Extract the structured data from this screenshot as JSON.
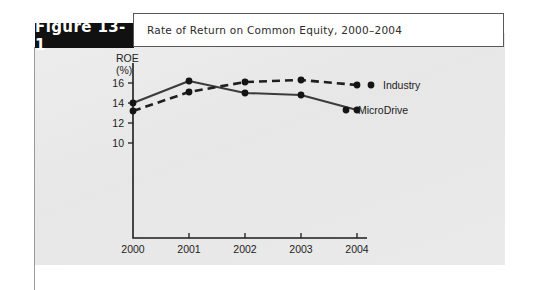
{
  "figure": {
    "tab_label": "Figure 13-1",
    "caption": "Rate of Return on Common Equity, 2000–2004"
  },
  "colors": {
    "tab_background": "#111111",
    "tab_text": "#ffffff",
    "panel_background": "#e9e9e9",
    "caption_background": "#ffffff",
    "caption_border": "#58585a",
    "axis": "#1d1d1d",
    "microdrive_line": "#3c3c3c",
    "industry_line": "#1f1f1f",
    "marker": "#141414"
  },
  "chart_data": {
    "type": "line",
    "title": "Rate of Return on Common Equity, 2000–2004",
    "xlabel": "",
    "ylabel": "ROE (%)",
    "ylabel_line1": "ROE",
    "ylabel_line2": "(%)",
    "categories": [
      "2000",
      "2001",
      "2002",
      "2003",
      "2004"
    ],
    "x": [
      2000,
      2001,
      2002,
      2003,
      2004
    ],
    "xtick_labels": [
      "2000",
      "2001",
      "2002",
      "2003",
      "2004"
    ],
    "ytick_labels": [
      "10",
      "12",
      "14",
      "16"
    ],
    "yticks": [
      10,
      12,
      14,
      16
    ],
    "ylim": [
      8.5,
      17.2
    ],
    "xlim": [
      2000,
      2004
    ],
    "grid": false,
    "legend_position": "right-inline",
    "series": [
      {
        "name": "MicroDrive",
        "style": "solid",
        "marker": "circle",
        "values": [
          14.0,
          16.2,
          15.0,
          14.8,
          13.3
        ]
      },
      {
        "name": "Industry",
        "style": "dashed",
        "marker": "circle",
        "values": [
          13.2,
          15.1,
          16.1,
          16.3,
          15.8
        ]
      }
    ]
  }
}
